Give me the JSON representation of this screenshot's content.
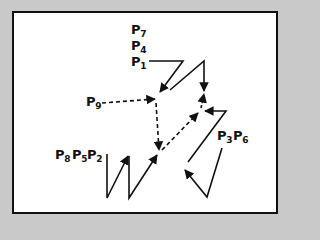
{
  "diagram": {
    "background_color": "#c9c9c9",
    "frame_color": "#111111",
    "labels": {
      "p7": {
        "main": "P",
        "sub": "7"
      },
      "p4": {
        "main": "P",
        "sub": "4"
      },
      "p1": {
        "main": "P",
        "sub": "1"
      },
      "p9": {
        "main": "P",
        "sub": "9"
      },
      "p3": {
        "main": "P",
        "sub": "3"
      },
      "p6": {
        "main": "P",
        "sub": "6"
      },
      "p8": {
        "main": "P",
        "sub": "8"
      },
      "p5": {
        "main": "P",
        "sub": "5"
      },
      "p2": {
        "main": "P",
        "sub": "2"
      }
    },
    "label_groups": [
      {
        "name": "P7 P4 P1 stack",
        "labels": [
          "P7",
          "P4",
          "P1"
        ]
      },
      {
        "name": "P9",
        "labels": [
          "P9"
        ]
      },
      {
        "name": "P3 P6",
        "labels": [
          "P3",
          "P6"
        ]
      },
      {
        "name": "P8 P5 P2",
        "labels": [
          "P8",
          "P5",
          "P2"
        ]
      }
    ],
    "connections": [
      {
        "from": "P1",
        "style": "solid",
        "description": "zigzag from P1 right then down-left to center-top point"
      },
      {
        "from": "center-top",
        "style": "solid",
        "description": "up-right then down to right convergence point"
      },
      {
        "from": "P9",
        "style": "dashed",
        "description": "to center-top point"
      },
      {
        "from": "center-top",
        "style": "dashed",
        "description": "down to center-bottom point"
      },
      {
        "from": "center-bottom",
        "style": "dashed",
        "description": "diagonal up-right to right convergence point"
      },
      {
        "from": "right convergence",
        "style": "dashed",
        "description": "short upward arrow"
      },
      {
        "from": "P3P6",
        "style": "solid",
        "description": "zigzag ending with arrows at right convergence and lower-left"
      },
      {
        "from": "P8P5P2",
        "style": "solid",
        "description": "W-shaped zigzag ending with arrows at center-bottom point"
      }
    ]
  }
}
